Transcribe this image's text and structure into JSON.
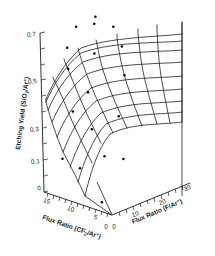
{
  "chart_data": {
    "type": "surface",
    "title": "",
    "zlabel": "Etching Yield (SiO2/Ar+)",
    "zlabel_parts": {
      "text_a": "Etching Yield (SiO",
      "sub": "2",
      "text_b": "/Ar",
      "sup": "+",
      "text_c": ")"
    },
    "xlabel": "Flux Ratio (CF2/Ar+)",
    "xlabel_parts": {
      "text_a": "Flux Ratio (CF",
      "sub": "2",
      "text_b": "/Ar",
      "sup": "+",
      "text_c": ")"
    },
    "ylabel": "Flux Ratio (F/Ar+)",
    "ylabel_parts": {
      "text_a": "Flux Ratio (F/Ar",
      "sup": "+",
      "text_b": ")"
    },
    "zticks": [
      "0.7",
      "0.5",
      "0.3",
      "0.1",
      "0"
    ],
    "ztick_values": [
      0.7,
      0.5,
      0.3,
      0.1,
      0.0
    ],
    "zlim": [
      0,
      0.8
    ],
    "xticks": [
      "15",
      "10",
      "5",
      "0"
    ],
    "xtick_values": [
      15,
      10,
      5,
      0
    ],
    "xlim": [
      0,
      17
    ],
    "yticks": [
      "0",
      "10",
      "20",
      "30"
    ],
    "ytick_values": [
      0,
      10,
      20,
      30
    ],
    "ylim": [
      0,
      33
    ],
    "grid": true,
    "legend": false,
    "mesh_rows": 9,
    "mesh_cols": 9,
    "surface_note": "Etching yield rises with F/Ar+ flux ratio and with CF2/Ar+ flux ratio, saturating near 0.75 at high flux ratios and falling to 0 at the origin.",
    "x_grid_values": [
      0,
      2.125,
      4.25,
      6.375,
      8.5,
      10.625,
      12.75,
      14.875,
      17
    ],
    "y_grid_values": [
      0,
      4.125,
      8.25,
      12.375,
      16.5,
      20.625,
      24.75,
      28.875,
      33
    ],
    "z_matrix": [
      [
        0.0,
        0.13,
        0.24,
        0.32,
        0.38,
        0.42,
        0.45,
        0.47,
        0.48
      ],
      [
        0.05,
        0.2,
        0.32,
        0.4,
        0.46,
        0.5,
        0.53,
        0.55,
        0.56
      ],
      [
        0.1,
        0.26,
        0.38,
        0.47,
        0.53,
        0.57,
        0.6,
        0.62,
        0.63
      ],
      [
        0.14,
        0.31,
        0.44,
        0.52,
        0.58,
        0.62,
        0.65,
        0.67,
        0.68
      ],
      [
        0.17,
        0.35,
        0.48,
        0.56,
        0.62,
        0.66,
        0.69,
        0.71,
        0.72
      ],
      [
        0.19,
        0.38,
        0.51,
        0.59,
        0.65,
        0.69,
        0.71,
        0.73,
        0.74
      ],
      [
        0.21,
        0.4,
        0.53,
        0.61,
        0.67,
        0.7,
        0.73,
        0.74,
        0.75
      ],
      [
        0.22,
        0.41,
        0.54,
        0.62,
        0.68,
        0.71,
        0.74,
        0.75,
        0.76
      ],
      [
        0.22,
        0.42,
        0.55,
        0.63,
        0.68,
        0.72,
        0.74,
        0.76,
        0.76
      ]
    ],
    "datapoints": [
      {
        "x": 14.9,
        "y": 20.6,
        "z": 0.74
      },
      {
        "x": 12.7,
        "y": 24.7,
        "z": 0.75
      },
      {
        "x": 14.9,
        "y": 28.9,
        "z": 0.75
      },
      {
        "x": 10.6,
        "y": 28.9,
        "z": 0.73
      },
      {
        "x": 8.5,
        "y": 16.5,
        "z": 0.67
      },
      {
        "x": 6.4,
        "y": 24.7,
        "z": 0.68
      },
      {
        "x": 12.7,
        "y": 12.4,
        "z": 0.69
      },
      {
        "x": 10.6,
        "y": 8.25,
        "z": 0.62
      },
      {
        "x": 4.25,
        "y": 20.6,
        "z": 0.57
      },
      {
        "x": 6.4,
        "y": 8.25,
        "z": 0.53
      },
      {
        "x": 2.1,
        "y": 12.4,
        "z": 0.42
      },
      {
        "x": 4.25,
        "y": 4.1,
        "z": 0.38
      },
      {
        "x": 8.5,
        "y": 4.1,
        "z": 0.44
      },
      {
        "x": 2.1,
        "y": 4.1,
        "z": 0.26
      },
      {
        "x": 0.0,
        "y": 8.25,
        "z": 0.24
      },
      {
        "x": 6.4,
        "y": 0.0,
        "z": 0.19
      },
      {
        "x": 2.1,
        "y": 0.0,
        "z": 0.05
      },
      {
        "x": 10.6,
        "y": 0.0,
        "z": 0.21
      }
    ]
  }
}
